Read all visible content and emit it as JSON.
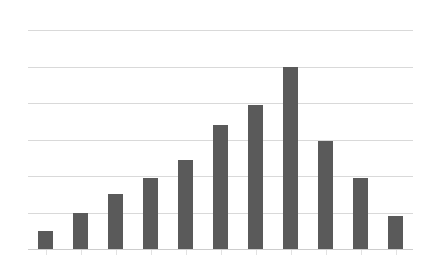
{
  "chart_data": {
    "type": "bar",
    "title": "",
    "subtitle": "",
    "xlabel": "",
    "ylabel": "",
    "categories": [
      "1",
      "2",
      "3",
      "4",
      "5",
      "6",
      "7",
      "8",
      "9",
      "10",
      "11"
    ],
    "values": [
      0.5,
      1.0,
      1.5,
      1.95,
      2.45,
      3.4,
      3.95,
      5.0,
      2.95,
      1.95,
      0.9
    ],
    "ylim": [
      0,
      6
    ],
    "yticks": [
      0,
      1,
      2,
      3,
      4,
      5,
      6
    ],
    "ytick_labels": [
      "",
      "",
      "",
      "",
      "",
      "",
      ""
    ],
    "xtick_labels": [
      "",
      "",
      "",
      "",
      "",
      "",
      "",
      "",
      "",
      "",
      ""
    ],
    "grid": {
      "horizontal": true,
      "vertical": false,
      "color": "#d9d9d9"
    },
    "legend": {
      "visible": false,
      "position": "none",
      "entries": []
    },
    "annotations": [],
    "series": [
      {
        "name": "",
        "color": "#5a5a5a",
        "values": [
          0.5,
          1.0,
          1.5,
          1.95,
          2.45,
          3.4,
          3.95,
          5.0,
          2.95,
          1.95,
          0.9
        ]
      }
    ],
    "style": {
      "background": "#ffffff",
      "bar_color": "#5a5a5a",
      "bar_width_ratio": 0.42,
      "axis_color": "#cdcdcd",
      "gridline_color": "#d9d9d9"
    }
  }
}
